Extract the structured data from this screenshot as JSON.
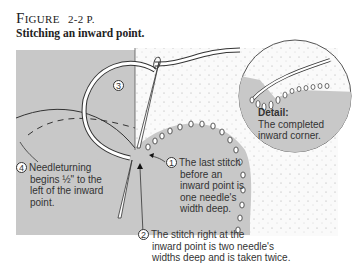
{
  "figure": {
    "label_prefix": "F",
    "label_rest": "IGURE",
    "number": "2-2 P.",
    "subtitle": "Stitching an inward point."
  },
  "callouts": [
    {
      "number": "1",
      "lines": [
        "The last stitch",
        "before an",
        "inward point is",
        "one needle's",
        "width deep."
      ]
    },
    {
      "number": "2",
      "lines": [
        "The stitch right at the",
        "inward point is two needle's",
        "widths deep and is taken twice."
      ]
    },
    {
      "number": "3",
      "lines": []
    },
    {
      "number": "4",
      "lines": [
        "Needleturning",
        "begins ½\" to the",
        "left of the inward",
        "point."
      ]
    }
  ],
  "detail": {
    "heading": "Detail:",
    "lines": [
      "The completed",
      "inward corner."
    ]
  },
  "colors": {
    "fabric_gray": "#c8c8c8",
    "background_dotted": "#f4f4f4",
    "line": "#333333",
    "thread": "#ffffff"
  }
}
